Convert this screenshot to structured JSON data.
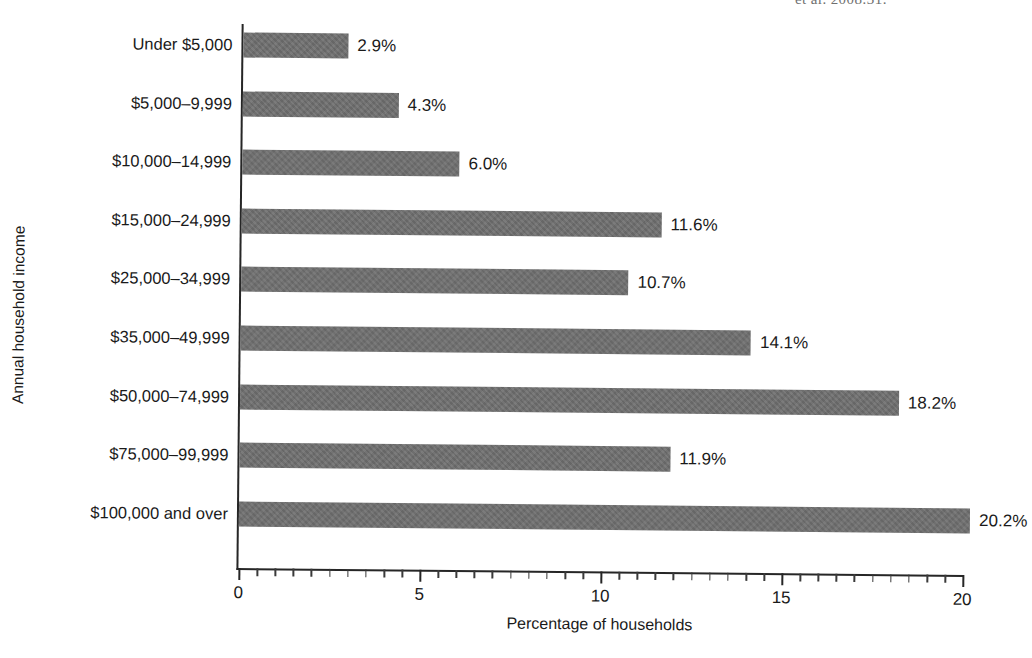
{
  "citation": {
    "fragment": "et al. 2008:31."
  },
  "chart_data": {
    "type": "bar",
    "orientation": "horizontal",
    "title": "",
    "xlabel": "Percentage of households",
    "ylabel": "Annual household income",
    "categories": [
      "Under $5,000",
      "$5,000–9,999",
      "$10,000–14,999",
      "$15,000–24,999",
      "$25,000–34,999",
      "$35,000–49,999",
      "$50,000–74,999",
      "$75,000–99,999",
      "$100,000 and over"
    ],
    "values": [
      2.9,
      4.3,
      6.0,
      11.6,
      10.7,
      14.1,
      18.2,
      11.9,
      20.2
    ],
    "data_labels": [
      "2.9%",
      "4.3%",
      "6.0%",
      "11.6%",
      "10.7%",
      "14.1%",
      "18.2%",
      "11.9%",
      "20.2%"
    ],
    "xlim": [
      0,
      20
    ],
    "xticks": [
      0,
      5,
      10,
      15,
      20
    ],
    "xtick_labels": [
      "0",
      "5",
      "10",
      "15",
      "20"
    ],
    "minor_tick_step": 0.5,
    "grid": false,
    "legend": false,
    "bar_color": "#6e6e6e",
    "axis_color": "#262626",
    "background": "#ffffff"
  }
}
